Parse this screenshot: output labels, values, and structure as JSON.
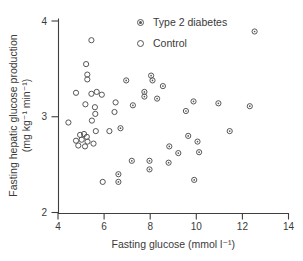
{
  "figure": {
    "background": "#ffffff",
    "axis_color": "#3f3f3f",
    "text_color": "#3a3a3a",
    "marker_color": "#565656"
  },
  "chart_data": {
    "type": "scatter",
    "title": "",
    "xlabel": "Fasting glucose (mmol l⁻¹)",
    "ylabel_line1": "Fasting hepatic glucose production",
    "ylabel_line2": "(mg kg⁻¹ min⁻¹)",
    "xlim": [
      4,
      14
    ],
    "ylim": [
      2,
      4
    ],
    "xticks": [
      4,
      6,
      8,
      10,
      12,
      14
    ],
    "yticks": [
      4,
      3,
      2
    ],
    "grid": false,
    "legend_position": "top-center",
    "series": [
      {
        "name": "Type 2 diabetes",
        "marker": "open-circle-dot",
        "points": [
          [
            6.62,
            2.4
          ],
          [
            6.62,
            2.32
          ],
          [
            6.71,
            2.88
          ],
          [
            6.96,
            3.38
          ],
          [
            7.2,
            2.54
          ],
          [
            7.25,
            3.12
          ],
          [
            7.75,
            3.26
          ],
          [
            7.75,
            3.21
          ],
          [
            7.97,
            2.54
          ],
          [
            7.97,
            2.45
          ],
          [
            8.04,
            3.43
          ],
          [
            8.1,
            3.38
          ],
          [
            8.3,
            3.19
          ],
          [
            8.55,
            3.32
          ],
          [
            8.8,
            2.52
          ],
          [
            8.83,
            2.69
          ],
          [
            9.22,
            2.62
          ],
          [
            9.55,
            3.06
          ],
          [
            9.65,
            2.8
          ],
          [
            9.88,
            3.16
          ],
          [
            9.91,
            2.34
          ],
          [
            10.05,
            2.74
          ],
          [
            10.12,
            2.63
          ],
          [
            10.96,
            3.14
          ],
          [
            11.45,
            2.85
          ],
          [
            12.32,
            3.11
          ],
          [
            12.53,
            3.89
          ]
        ]
      },
      {
        "name": "Control",
        "marker": "open-circle",
        "points": [
          [
            4.45,
            2.94
          ],
          [
            4.78,
            3.25
          ],
          [
            4.78,
            2.75
          ],
          [
            4.88,
            2.7
          ],
          [
            4.96,
            2.81
          ],
          [
            5.03,
            2.76
          ],
          [
            5.13,
            2.82
          ],
          [
            5.17,
            2.69
          ],
          [
            5.19,
            3.13
          ],
          [
            5.22,
            3.55
          ],
          [
            5.25,
            2.79
          ],
          [
            5.27,
            3.44
          ],
          [
            5.27,
            3.39
          ],
          [
            5.28,
            2.74
          ],
          [
            5.45,
            3.8
          ],
          [
            5.45,
            3.24
          ],
          [
            5.47,
            2.96
          ],
          [
            5.54,
            2.72
          ],
          [
            5.6,
            3.1
          ],
          [
            5.62,
            3.03
          ],
          [
            5.64,
            2.85
          ],
          [
            5.68,
            3.26
          ],
          [
            5.9,
            3.23
          ],
          [
            5.94,
            2.32
          ],
          [
            6.23,
            2.85
          ],
          [
            6.45,
            3.05
          ],
          [
            6.5,
            3.15
          ]
        ]
      }
    ]
  }
}
